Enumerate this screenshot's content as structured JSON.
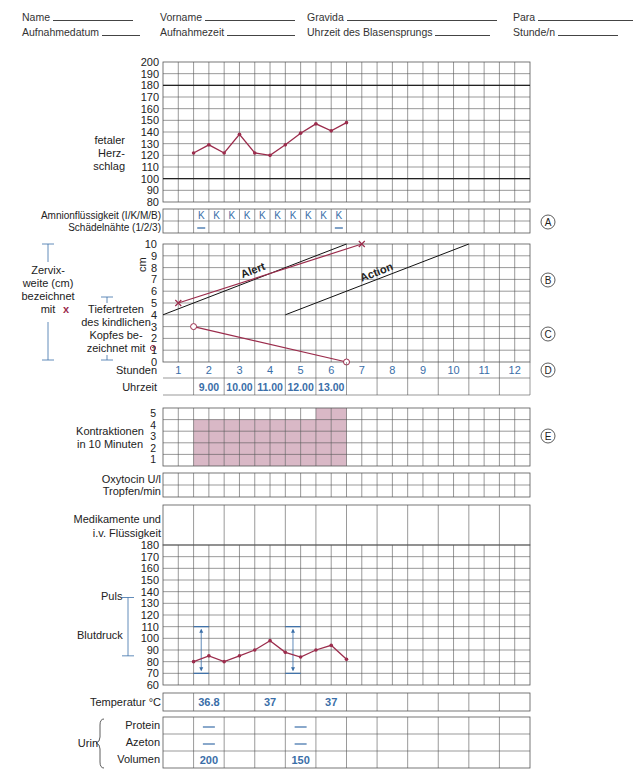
{
  "page_header": {
    "section": "3.12 · Geburtsbefund",
    "page": "51"
  },
  "form_fields": {
    "row1": [
      {
        "label": "Name",
        "x": 22,
        "w": 80
      },
      {
        "label": "Vorname",
        "x": 160,
        "w": 90
      },
      {
        "label": "Gravida",
        "x": 307,
        "w": 150
      },
      {
        "label": "Para",
        "x": 513,
        "w": 95
      }
    ],
    "row2": [
      {
        "label": "Aufnahmedatum",
        "x": 22,
        "w": 38
      },
      {
        "label": "Aufnahmezeit",
        "x": 160,
        "w": 68
      },
      {
        "label": "Uhrzeit des Blasensprungs",
        "x": 307,
        "w": 55
      },
      {
        "label": "Stunde/n",
        "x": 513,
        "w": 60
      }
    ]
  },
  "grid": {
    "left": 163,
    "right": 530,
    "columns": 24
  },
  "colors": {
    "plot": "#9b2c4c",
    "blue": "#3a6ea8",
    "shade": "#d9b8c6",
    "grid": "#555",
    "thick": "#222"
  },
  "fhr": {
    "label": [
      "fetaler",
      "Herz-",
      "schlag"
    ],
    "yticks": [
      200,
      190,
      180,
      170,
      160,
      150,
      140,
      130,
      120,
      110,
      100,
      90,
      80
    ],
    "top": 62,
    "bottom": 202,
    "bold_lines": [
      180,
      100
    ],
    "chart_data": {
      "type": "line",
      "title": "fetaler Herzschlag",
      "x_halfhours": [
        2,
        3,
        4,
        5,
        6,
        7,
        8,
        9,
        10,
        11,
        12
      ],
      "values": [
        122,
        129,
        122,
        138,
        122,
        120,
        129,
        139,
        147,
        141,
        148
      ],
      "ylim": [
        80,
        200
      ]
    }
  },
  "amnion": {
    "label1": "Amnionflüssigkeit (I/K/M/B)",
    "label2": "Schädelnähte (1/2/3)",
    "top": 209,
    "bottom": 233,
    "fluid": [
      "",
      "",
      "K",
      "K",
      "K",
      "K",
      "K",
      "K",
      "K",
      "K",
      "K",
      "K",
      "",
      "",
      "",
      "",
      "",
      "",
      "",
      "",
      "",
      "",
      "",
      ""
    ],
    "sutures_dash_cols": [
      2,
      11
    ],
    "marker": "A"
  },
  "partogram": {
    "top": 244,
    "bottom": 362,
    "yticks": [
      "10",
      "9",
      "8",
      "7",
      "6",
      "5",
      "4",
      "3",
      "2",
      "1",
      "0"
    ],
    "unit": "cm",
    "cervix_label": [
      "Zervix-",
      "weite (cm)",
      "bezeichnet",
      "mit"
    ],
    "cervix_symbol": "x",
    "head_label": [
      "Tiefertreten",
      "des kindlichen",
      "Kopfes be-",
      "zeichnet mit"
    ],
    "head_symbol": "o",
    "alert_label": "Alert",
    "action_label": "Action",
    "markers": [
      "B",
      "C",
      "D"
    ],
    "chart_data": {
      "type": "line",
      "x_unit": "hours",
      "alert_line": [
        [
          0,
          4
        ],
        [
          6,
          10
        ]
      ],
      "action_line": [
        [
          4,
          4
        ],
        [
          10,
          10
        ]
      ],
      "cervix_dilation": [
        [
          0.5,
          5
        ],
        [
          6.5,
          10
        ]
      ],
      "head_descent": [
        [
          1,
          3
        ],
        [
          6,
          0
        ]
      ],
      "ylim": [
        0,
        10
      ]
    },
    "stunden_label": "Stunden",
    "stunden": [
      "1",
      "2",
      "3",
      "4",
      "5",
      "6",
      "7",
      "8",
      "9",
      "10",
      "11",
      "12"
    ],
    "uhrzeit_label": "Uhrzeit",
    "uhrzeit": [
      "",
      "9.00",
      "10.00",
      "11.00",
      "12.00",
      "13.00",
      "",
      "",
      "",
      "",
      "",
      ""
    ]
  },
  "contractions": {
    "label": [
      "Kontraktionen",
      "in 10 Minuten"
    ],
    "yticks": [
      "5",
      "4",
      "3",
      "2",
      "1"
    ],
    "top": 408,
    "bottom": 466,
    "marker": "E",
    "chart_data": {
      "type": "bar",
      "x_halfhours": [
        2,
        3,
        4,
        5,
        6,
        7,
        8,
        9,
        10,
        11
      ],
      "values": [
        4,
        4,
        4,
        4,
        4,
        4,
        4,
        4,
        5,
        5
      ],
      "ylim": [
        0,
        5
      ]
    }
  },
  "oxytocin": {
    "label": [
      "Oxytocin U/l",
      "Tropfen/min"
    ],
    "top": 473,
    "bottom": 497
  },
  "medication": {
    "label": [
      "Medikamente und",
      "i.v. Flüssigkeit"
    ],
    "top": 505,
    "bottom": 545
  },
  "vitals": {
    "puls_label": "Puls",
    "bp_label": "Blutdruck",
    "yticks": [
      180,
      170,
      160,
      150,
      140,
      130,
      120,
      110,
      100,
      90,
      80,
      70,
      60
    ],
    "top": 545,
    "bottom": 685,
    "chart_data": {
      "type": "line",
      "pulse": {
        "x_halfhours": [
          2,
          3,
          4,
          5,
          6,
          7,
          8,
          9,
          10,
          11,
          12
        ],
        "values": [
          80,
          85,
          80,
          85,
          90,
          98,
          88,
          84,
          90,
          94,
          82
        ]
      },
      "blood_pressure": [
        {
          "x_halfhour": 2,
          "systolic": 110,
          "diastolic": 70
        },
        {
          "x_halfhour": 8,
          "systolic": 110,
          "diastolic": 70
        }
      ],
      "ylim": [
        60,
        180
      ]
    }
  },
  "temperature": {
    "label": "Temperatur °C",
    "top": 693,
    "bottom": 711,
    "values": [
      "",
      "36.8",
      "",
      "37",
      "",
      "37",
      "",
      "",
      "",
      "",
      "",
      ""
    ]
  },
  "urine": {
    "label": "Urin",
    "top": 717,
    "bottom": 768,
    "rows": [
      {
        "label": "Protein",
        "values": [
          "",
          "—",
          "",
          "",
          "—",
          "",
          "",
          "",
          "",
          "",
          "",
          ""
        ]
      },
      {
        "label": "Azeton",
        "values": [
          "",
          "—",
          "",
          "",
          "—",
          "",
          "",
          "",
          "",
          "",
          "",
          ""
        ]
      },
      {
        "label": "Volumen",
        "values": [
          "",
          "200",
          "",
          "",
          "150",
          "",
          "",
          "",
          "",
          "",
          "",
          ""
        ]
      }
    ]
  }
}
